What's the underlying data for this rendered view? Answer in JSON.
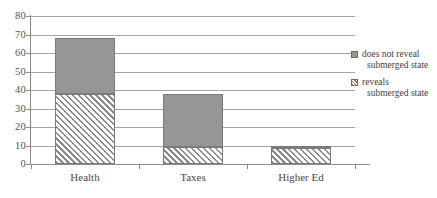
{
  "chart_data": {
    "type": "bar",
    "title": "",
    "subtitle": "",
    "xlabel": "",
    "ylabel": "",
    "stacked": true,
    "grid": true,
    "legend_position": "right",
    "ylim": [
      0,
      80
    ],
    "ytick_step": 10,
    "ytick_labels": [
      "80",
      "70",
      "60",
      "50",
      "40",
      "30",
      "20",
      "10",
      "0"
    ],
    "ytick_values": [
      80,
      70,
      60,
      50,
      40,
      30,
      20,
      10,
      0
    ],
    "categories": [
      "Health",
      "Taxes",
      "Higher Ed"
    ],
    "series": [
      {
        "name": "reveals submerged state",
        "name_line1": "reveals",
        "name_line2": "submerged state",
        "pattern": "diagonal-hatch",
        "color": "#ffffff",
        "hatch_color": "#8e8c8a",
        "values": [
          38,
          9,
          8.5
        ]
      },
      {
        "name": "does not reveal submerged state",
        "name_line1": "does not reveal",
        "name_line2": "submerged state",
        "pattern": "solid",
        "color": "#969696",
        "values": [
          30,
          29,
          1.5
        ]
      }
    ],
    "totals": [
      68,
      38,
      10
    ],
    "annotations": []
  },
  "legend": {
    "items": [
      {
        "line1": "does not reveal",
        "line2": "submerged state",
        "swatch": "solid-gray-square"
      },
      {
        "line1": "reveals",
        "line2": "submerged state",
        "swatch": "hatched-square"
      }
    ]
  },
  "colors": {
    "solid_fill": "#969696",
    "hatch_line": "#8e8c8a",
    "gridline": "#a8a6a4",
    "axis": "#8d8b89",
    "text": "#4a4a4a",
    "background": "#ffffff"
  }
}
